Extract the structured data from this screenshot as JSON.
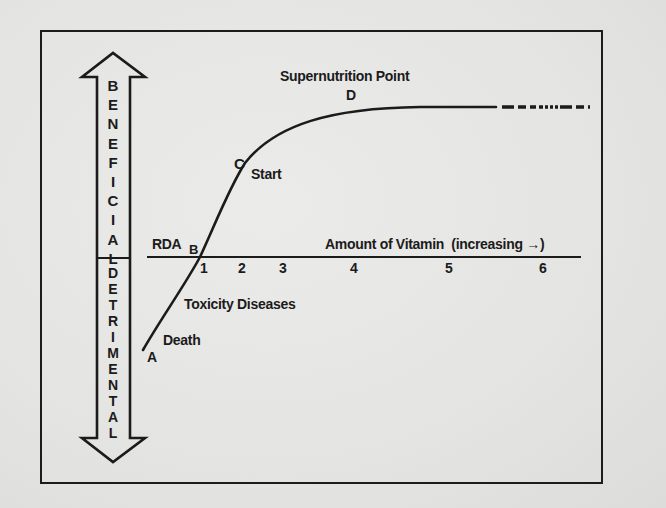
{
  "diagram": {
    "colors": {
      "background": "#e6e6e4",
      "ink": "#1b1b1b"
    },
    "vertical_arrow": {
      "beneficial_label": "BENEFICIAL",
      "beneficial_letters": [
        "B",
        "E",
        "N",
        "E",
        "F",
        "I",
        "C",
        "I",
        "A",
        "L"
      ],
      "detrimental_label": "DETRIMENTAL",
      "detrimental_letters": [
        "D",
        "E",
        "T",
        "R",
        "I",
        "M",
        "E",
        "N",
        "T",
        "A",
        "L"
      ]
    },
    "axis": {
      "label": "Amount of Vitamin",
      "direction_note": "(increasing",
      "direction_arrow": "→)",
      "rda_label": "RDA",
      "ticks": [
        "1",
        "2",
        "3",
        "4",
        "5",
        "6"
      ]
    },
    "curve_points": [
      {
        "id": "A",
        "label": "A",
        "annotation": "Death"
      },
      {
        "id": "B",
        "label": "B",
        "annotation": "RDA"
      },
      {
        "id": "C",
        "label": "C",
        "annotation": "Start"
      },
      {
        "id": "D",
        "label": "D",
        "annotation": "Supernutrition Point"
      }
    ],
    "annotations": {
      "supernutrition": "Supernutrition Point",
      "start": "Start",
      "toxicity": "Toxicity Diseases",
      "death": "Death"
    }
  }
}
